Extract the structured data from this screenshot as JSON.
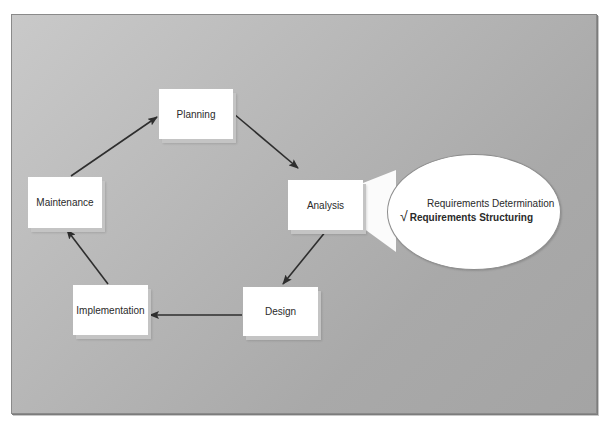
{
  "diagram": {
    "type": "cycle",
    "title": "",
    "nodes": [
      {
        "id": "planning",
        "label": "Planning"
      },
      {
        "id": "analysis",
        "label": "Analysis"
      },
      {
        "id": "design",
        "label": "Design"
      },
      {
        "id": "implementation",
        "label": "Implementation"
      },
      {
        "id": "maintenance",
        "label": "Maintenance"
      }
    ],
    "edges": [
      {
        "from": "planning",
        "to": "analysis"
      },
      {
        "from": "analysis",
        "to": "design"
      },
      {
        "from": "design",
        "to": "implementation"
      },
      {
        "from": "implementation",
        "to": "maintenance"
      },
      {
        "from": "maintenance",
        "to": "planning"
      }
    ],
    "callout": {
      "attached_to": "analysis",
      "items": [
        {
          "label": "Requirements Determination",
          "checked": false
        },
        {
          "label": "Requirements Structuring",
          "checked": true
        }
      ],
      "check_glyph": "√"
    }
  },
  "colors": {
    "background_panel": "#b8b8b8",
    "box_fill": "#ffffff",
    "arrow": "#2e2e2e"
  }
}
